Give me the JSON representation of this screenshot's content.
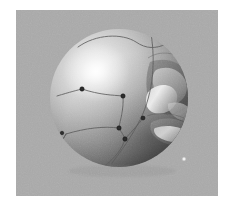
{
  "scene": {
    "title": "Shaded sphere render",
    "background_color": "#ffffff",
    "panel_color": "#a8a8a8",
    "panel": {
      "x": 16,
      "y": 10,
      "width": 202,
      "height": 186
    }
  },
  "sphere": {
    "name": "sphere-body",
    "center_x": 119,
    "center_y": 98,
    "radius": 69,
    "base_color": "#9a9a9a",
    "highlight_color": "#f2f2f2",
    "shadow_color": "#4e4e4e",
    "highlight_x": 96,
    "highlight_y": 72
  },
  "feature": {
    "name": "raised-lobe",
    "label": "protrusion",
    "x": 152,
    "y": 95,
    "width": 44,
    "height": 70,
    "light_color": "#e6e6e6",
    "dark_color": "#545454"
  },
  "chart_data": {
    "type": "scatter",
    "xlabel": "",
    "ylabel": "",
    "xlim": [
      16,
      218
    ],
    "ylim": [
      10,
      196
    ],
    "grid": false,
    "legend": "none",
    "marker_color": "#2b2b2b",
    "curve_color": "#5a5a5a",
    "points": [
      {
        "id": "p1",
        "x": 82,
        "y": 89,
        "r": 2.2,
        "kind": "dark-marker"
      },
      {
        "id": "p2",
        "x": 123,
        "y": 96,
        "r": 2.2,
        "kind": "dark-marker"
      },
      {
        "id": "p3",
        "x": 119,
        "y": 128,
        "r": 2.2,
        "kind": "dark-marker"
      },
      {
        "id": "p4",
        "x": 125,
        "y": 139,
        "r": 2.2,
        "kind": "dark-marker"
      },
      {
        "id": "p5",
        "x": 143,
        "y": 118,
        "r": 2.0,
        "kind": "dark-marker"
      },
      {
        "id": "p6",
        "x": 62,
        "y": 133,
        "r": 1.8,
        "kind": "dark-marker"
      },
      {
        "id": "p7",
        "x": 57,
        "y": 143,
        "r": 1.8,
        "kind": "dark-marker"
      },
      {
        "id": "p8",
        "x": 52,
        "y": 151,
        "r": 1.8,
        "kind": "dark-marker"
      },
      {
        "id": "p9",
        "x": 184,
        "y": 159,
        "r": 1.7,
        "kind": "light-marker"
      }
    ],
    "curves": [
      {
        "id": "c1",
        "label": "top-arc",
        "path": "M 78 47 C 96 34, 122 33, 136 42 C 146 49, 156 49, 166 44"
      },
      {
        "id": "c2",
        "label": "right-meridian",
        "path": "M 150 28 C 156 58, 154 92, 140 120 C 132 136, 122 150, 112 163"
      },
      {
        "id": "c3",
        "label": "center-branch",
        "path": "M 82 89 C 100 95, 112 95, 123 96"
      },
      {
        "id": "c4",
        "label": "lower-branch",
        "path": "M 123 96 C 124 110, 120 120, 119 128"
      },
      {
        "id": "c5",
        "label": "left-sweep",
        "path": "M 119 128 C 104 126, 86 128, 66 134"
      },
      {
        "id": "c6",
        "label": "tail-a",
        "path": "M 66 134 C 62 141, 59 147, 56 153"
      },
      {
        "id": "c7",
        "label": "tail-b",
        "path": "M 66 134 C 61 142, 57 148, 52 152"
      },
      {
        "id": "c8",
        "label": "bottom-branch",
        "path": "M 119 128 C 122 133, 124 136, 125 139"
      },
      {
        "id": "c9",
        "label": "bottom-sweep",
        "path": "M 125 139 C 122 150, 114 158, 106 165"
      },
      {
        "id": "c10",
        "label": "right-branch",
        "path": "M 125 139 C 133 130, 139 124, 143 118"
      },
      {
        "id": "c11",
        "label": "upper-left-arc",
        "path": "M 57 96 C 70 92, 78 90, 82 89"
      }
    ]
  }
}
